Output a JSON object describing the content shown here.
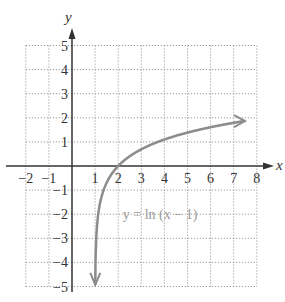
{
  "chart_data": {
    "type": "line",
    "title": "",
    "xlabel": "x",
    "ylabel": "y",
    "xlim": [
      -2,
      8
    ],
    "ylim": [
      -5,
      5
    ],
    "grid": true,
    "x_ticks": [
      "-2",
      "-1",
      "1",
      "2",
      "3",
      "4",
      "5",
      "6",
      "7",
      "8"
    ],
    "y_ticks": [
      "5",
      "4",
      "3",
      "2",
      "1",
      "-1",
      "-2",
      "-3",
      "-4",
      "-5"
    ],
    "series": [
      {
        "name": "y = ln (x − 1)",
        "function": "ln(x-1)",
        "color": "#8c8c8c",
        "x": [
          1.007,
          1.02,
          1.05,
          1.1,
          1.2,
          1.4,
          1.7,
          2,
          2.5,
          3,
          4,
          5,
          6,
          7,
          7.5
        ],
        "y": [
          -4.96,
          -3.91,
          -3.0,
          -2.3,
          -1.61,
          -0.92,
          -0.36,
          0,
          0.41,
          0.69,
          1.1,
          1.39,
          1.61,
          1.79,
          1.87
        ]
      }
    ],
    "annotations": [
      {
        "text": "y = ln (x − 1)",
        "x": 2.2,
        "y": -2
      }
    ]
  },
  "labels": {
    "x_axis": "x",
    "y_axis": "y",
    "equation": "y = ln (x − 1)"
  },
  "colors": {
    "axis": "#333333",
    "grid": "#9a9a9a",
    "curve": "#8c8c8c"
  }
}
